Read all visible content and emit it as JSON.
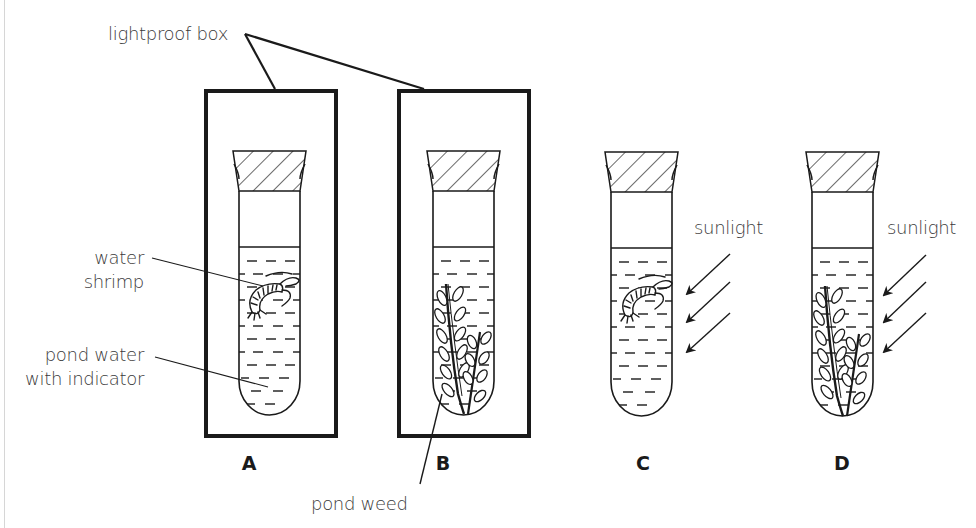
{
  "diagram": {
    "labels": {
      "lightproof_box": "lightproof box",
      "water_shrimp_line1": "water",
      "water_shrimp_line2": "shrimp",
      "pond_water_line1": "pond water",
      "pond_water_line2": "with indicator",
      "pond_weed": "pond weed",
      "sunlight_c": "sunlight",
      "sunlight_d": "sunlight"
    },
    "tubes": [
      {
        "id": "A",
        "label": "A",
        "contents": "water shrimp",
        "in_lightproof_box": true,
        "sunlight": false
      },
      {
        "id": "B",
        "label": "B",
        "contents": "pond weed",
        "in_lightproof_box": true,
        "sunlight": false
      },
      {
        "id": "C",
        "label": "C",
        "contents": "water shrimp",
        "in_lightproof_box": false,
        "sunlight": true
      },
      {
        "id": "D",
        "label": "D",
        "contents": "pond weed",
        "in_lightproof_box": false,
        "sunlight": true
      }
    ],
    "colors": {
      "line": "#1a1a1a",
      "text": "#3a3a3a",
      "background": "#ffffff"
    }
  }
}
